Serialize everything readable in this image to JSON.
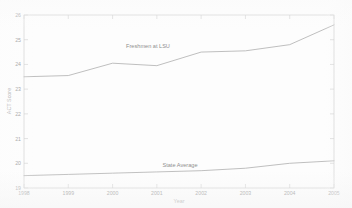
{
  "figure": {
    "background_color": "#fdfdfd",
    "line_color": "#b3b3b3",
    "axis_color": "#c9c9c9",
    "text_color": "#8a8a8a"
  },
  "axis": {
    "xlabel": "Year",
    "ylabel": "ACT Score",
    "ytick_labels": [
      "26",
      "25",
      "24",
      "23",
      "22",
      "21",
      "20",
      "19"
    ],
    "xtick_labels": [
      "1998",
      "1999",
      "2000",
      "2001",
      "2002",
      "2003",
      "2004",
      "2005"
    ]
  },
  "annotations": {
    "upper_series_label": "Freshmen at LSU",
    "lower_series_label": "State Average"
  },
  "chart_data": {
    "type": "line",
    "title": "",
    "xlabel": "Year",
    "ylabel": "ACT Score",
    "x": [
      1998,
      1999,
      2000,
      2001,
      2002,
      2003,
      2004,
      2005
    ],
    "xlim": [
      1998,
      2005
    ],
    "ylim": [
      19,
      26
    ],
    "ytick_values": [
      19,
      20,
      21,
      22,
      23,
      24,
      25,
      26
    ],
    "grid": false,
    "legend_position": "inline-annotation",
    "series": [
      {
        "name": "Freshmen at LSU",
        "values": [
          23.5,
          23.55,
          24.05,
          23.95,
          24.5,
          24.55,
          24.8,
          25.6
        ]
      },
      {
        "name": "State Average",
        "values": [
          19.5,
          19.55,
          19.6,
          19.65,
          19.7,
          19.8,
          20.0,
          20.1
        ]
      }
    ]
  }
}
